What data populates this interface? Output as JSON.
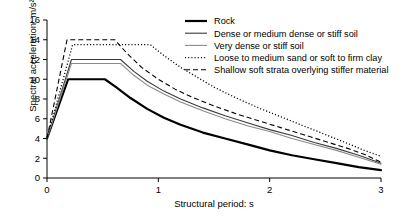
{
  "chart_data": {
    "type": "line",
    "title": "",
    "xlabel": "Structural period: s",
    "ylabel": "Spectral acceleration: m/s²",
    "xlim": [
      0,
      3
    ],
    "ylim": [
      0,
      16
    ],
    "xticks": [
      0,
      1,
      2,
      3
    ],
    "xtick_labels": [
      "0",
      "1",
      "2",
      "3"
    ],
    "yticks": [
      0,
      2,
      4,
      6,
      8,
      10,
      12,
      14,
      16
    ],
    "ytick_labels": [
      "0",
      "2",
      "4",
      "6",
      "8",
      "10",
      "12",
      "14",
      "16"
    ],
    "grid": false,
    "legend_position": "top-right",
    "series": [
      {
        "name": "Rock",
        "style": "solid",
        "color": "#000000",
        "width": 2.2,
        "points": [
          [
            0.0,
            4.0
          ],
          [
            0.19,
            10.0
          ],
          [
            0.52,
            10.0
          ],
          [
            0.62,
            9.2
          ],
          [
            0.75,
            8.1
          ],
          [
            0.9,
            7.0
          ],
          [
            1.05,
            6.1
          ],
          [
            1.2,
            5.4
          ],
          [
            1.4,
            4.6
          ],
          [
            1.6,
            4.0
          ],
          [
            1.8,
            3.4
          ],
          [
            2.0,
            2.8
          ],
          [
            2.2,
            2.3
          ],
          [
            2.4,
            1.9
          ],
          [
            2.6,
            1.5
          ],
          [
            2.8,
            1.1
          ],
          [
            3.0,
            0.8
          ]
        ]
      },
      {
        "name": "Dense or medium dense or stiff soil",
        "style": "solid",
        "color": "#3a3a3a",
        "width": 1.1,
        "points": [
          [
            0.0,
            4.0
          ],
          [
            0.22,
            12.0
          ],
          [
            0.66,
            12.0
          ],
          [
            0.78,
            10.8
          ],
          [
            0.9,
            9.8
          ],
          [
            1.05,
            8.8
          ],
          [
            1.2,
            8.0
          ],
          [
            1.4,
            7.1
          ],
          [
            1.6,
            6.3
          ],
          [
            1.8,
            5.6
          ],
          [
            2.0,
            4.9
          ],
          [
            2.2,
            4.3
          ],
          [
            2.4,
            3.6
          ],
          [
            2.6,
            3.0
          ],
          [
            2.8,
            2.3
          ],
          [
            3.0,
            1.5
          ]
        ]
      },
      {
        "name": "Very dense or stiff soil",
        "style": "solid",
        "color": "#8a8a8a",
        "width": 1.1,
        "points": [
          [
            0.0,
            4.0
          ],
          [
            0.22,
            11.6
          ],
          [
            0.66,
            11.6
          ],
          [
            0.78,
            10.4
          ],
          [
            0.9,
            9.4
          ],
          [
            1.05,
            8.5
          ],
          [
            1.2,
            7.7
          ],
          [
            1.4,
            6.8
          ],
          [
            1.6,
            6.0
          ],
          [
            1.8,
            5.3
          ],
          [
            2.0,
            4.7
          ],
          [
            2.2,
            4.0
          ],
          [
            2.4,
            3.4
          ],
          [
            2.6,
            2.8
          ],
          [
            2.8,
            2.1
          ],
          [
            3.0,
            1.4
          ]
        ]
      },
      {
        "name": "Loose to medium sand or soft to firm clay",
        "style": "dotted",
        "color": "#000000",
        "width": 1.3,
        "points": [
          [
            0.0,
            4.0
          ],
          [
            0.23,
            13.5
          ],
          [
            0.93,
            13.5
          ],
          [
            1.05,
            12.4
          ],
          [
            1.2,
            11.2
          ],
          [
            1.35,
            10.2
          ],
          [
            1.5,
            9.2
          ],
          [
            1.7,
            8.1
          ],
          [
            1.9,
            7.1
          ],
          [
            2.1,
            6.2
          ],
          [
            2.3,
            5.3
          ],
          [
            2.5,
            4.4
          ],
          [
            2.7,
            3.5
          ],
          [
            2.85,
            2.8
          ],
          [
            3.0,
            2.2
          ]
        ]
      },
      {
        "name": "Shallow soft strata overlying stiffer material",
        "style": "dashed",
        "color": "#000000",
        "width": 1.1,
        "points": [
          [
            0.0,
            4.0
          ],
          [
            0.18,
            14.0
          ],
          [
            0.61,
            14.0
          ],
          [
            0.72,
            12.6
          ],
          [
            0.85,
            11.2
          ],
          [
            1.0,
            10.0
          ],
          [
            1.15,
            9.0
          ],
          [
            1.3,
            8.2
          ],
          [
            1.5,
            7.3
          ],
          [
            1.7,
            6.5
          ],
          [
            1.9,
            5.8
          ],
          [
            2.1,
            5.1
          ],
          [
            2.3,
            4.4
          ],
          [
            2.5,
            3.7
          ],
          [
            2.7,
            3.0
          ],
          [
            2.85,
            2.4
          ],
          [
            3.0,
            1.6
          ]
        ]
      }
    ],
    "legend_entries": [
      "Rock",
      "Dense or medium dense or stiff soil",
      "Very dense or stiff soil",
      "Loose to medium sand or soft to firm clay",
      "Shallow soft strata overlying stiffer material"
    ]
  }
}
